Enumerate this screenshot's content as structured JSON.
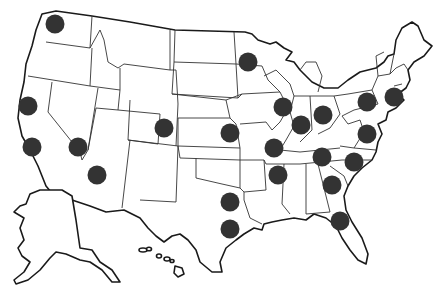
{
  "map": {
    "title": "United States locations map",
    "region": "United States",
    "background": "#ffffff",
    "line_color": "#1a1a1a",
    "marker_color": "#333333",
    "marker_radius": 9.5,
    "insets": [
      "Alaska",
      "Hawaii"
    ],
    "markers": [
      {
        "id": "seattle",
        "x": 55,
        "y": 24
      },
      {
        "id": "san-francisco",
        "x": 28,
        "y": 106
      },
      {
        "id": "los-angeles",
        "x": 32,
        "y": 147
      },
      {
        "id": "las-vegas",
        "x": 78,
        "y": 147
      },
      {
        "id": "phoenix",
        "x": 97,
        "y": 175
      },
      {
        "id": "denver",
        "x": 164,
        "y": 128
      },
      {
        "id": "kansas-city",
        "x": 230,
        "y": 133
      },
      {
        "id": "minneapolis",
        "x": 248,
        "y": 62
      },
      {
        "id": "chicago",
        "x": 283,
        "y": 107
      },
      {
        "id": "indianapolis",
        "x": 301,
        "y": 125
      },
      {
        "id": "st-louis",
        "x": 274,
        "y": 148
      },
      {
        "id": "columbus",
        "x": 323,
        "y": 115
      },
      {
        "id": "philadelphia",
        "x": 367,
        "y": 102
      },
      {
        "id": "new-york",
        "x": 394,
        "y": 97
      },
      {
        "id": "washington-dc",
        "x": 367,
        "y": 134
      },
      {
        "id": "nashville",
        "x": 322,
        "y": 157
      },
      {
        "id": "charlotte",
        "x": 354,
        "y": 162
      },
      {
        "id": "memphis",
        "x": 278,
        "y": 175
      },
      {
        "id": "atlanta",
        "x": 332,
        "y": 185
      },
      {
        "id": "dallas",
        "x": 230,
        "y": 202
      },
      {
        "id": "houston",
        "x": 230,
        "y": 229
      },
      {
        "id": "jacksonville",
        "x": 340,
        "y": 221
      }
    ]
  }
}
